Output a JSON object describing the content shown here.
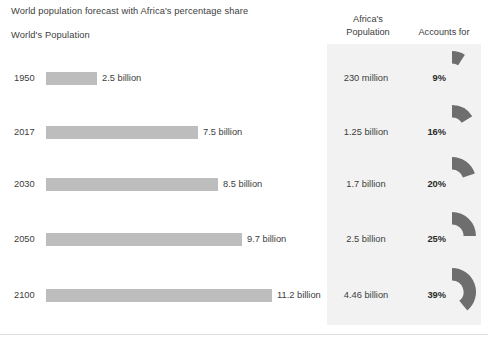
{
  "header": {
    "title": "World population forecast with Africa's percentage share",
    "left_column_title": "World's Population",
    "africa_column_title_line1": "Africa's",
    "africa_column_title_line2": "Population",
    "accounts_column_title": "Accounts for"
  },
  "colors": {
    "bar": "#bdbdbd",
    "wedge": "#6e6e6e",
    "panel_background": "#f2f2f2",
    "text": "#3d3d3d",
    "page_background": "#ffffff"
  },
  "chart_data": {
    "type": "bar",
    "title": "World population forecast with Africa's percentage share",
    "xlabel": "",
    "ylabel": "",
    "categories": [
      "1950",
      "2017",
      "2030",
      "2050",
      "2100"
    ],
    "values": [
      2.5,
      7.5,
      8.5,
      9.7,
      11.2
    ],
    "value_labels": [
      "2.5 billion",
      "7.5 billion",
      "8.5 billion",
      "9.7 billion",
      "11.2 billion"
    ],
    "unit": "billion people",
    "xlim": [
      0,
      11.2
    ],
    "grid": false,
    "legend": "none",
    "series": [
      {
        "name": "World's Population",
        "values": [
          2.5,
          7.5,
          8.5,
          9.7,
          11.2
        ]
      },
      {
        "name": "Africa's Population",
        "values": [
          0.23,
          1.25,
          1.7,
          2.5,
          4.46
        ],
        "labels": [
          "230 million",
          "1.25 billion",
          "1.7 billion",
          "2.5 billion",
          "4.46 billion"
        ]
      },
      {
        "name": "Africa accounts for (%)",
        "values": [
          9,
          16,
          20,
          25,
          39
        ],
        "labels": [
          "9%",
          "16%",
          "20%",
          "25%",
          "39%"
        ]
      }
    ]
  },
  "rows": [
    {
      "year": "1950",
      "world_population": "2.5 billion",
      "world_value": 2.5,
      "africa_population": "230 million",
      "percent_label": "9%",
      "percent_value": 9
    },
    {
      "year": "2017",
      "world_population": "7.5 billion",
      "world_value": 7.5,
      "africa_population": "1.25 billion",
      "percent_label": "16%",
      "percent_value": 16
    },
    {
      "year": "2030",
      "world_population": "8.5 billion",
      "world_value": 8.5,
      "africa_population": "1.7 billion",
      "percent_label": "20%",
      "percent_value": 20
    },
    {
      "year": "2050",
      "world_population": "9.7 billion",
      "world_value": 9.7,
      "africa_population": "2.5 billion",
      "percent_label": "25%",
      "percent_value": 25
    },
    {
      "year": "2100",
      "world_population": "11.2 billion",
      "world_value": 11.2,
      "africa_population": "4.46 billion",
      "percent_label": "39%",
      "percent_value": 39
    }
  ]
}
